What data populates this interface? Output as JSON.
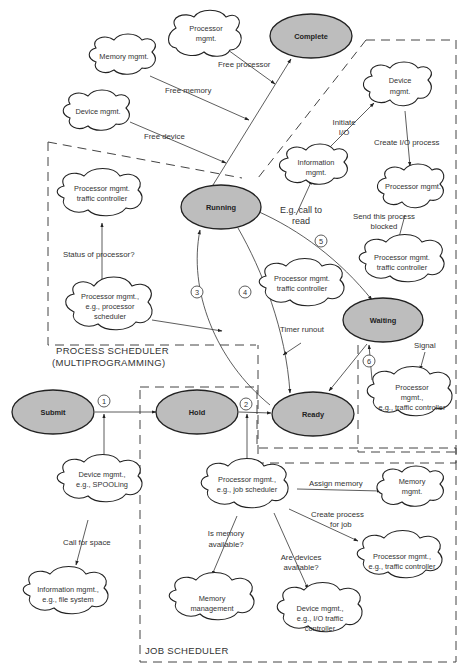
{
  "states": {
    "complete": "Complete",
    "running": "Running",
    "waiting": "Waiting",
    "submit": "Submit",
    "hold": "Hold",
    "ready": "Ready"
  },
  "clouds": {
    "processor_top": [
      "Processor",
      "mgmt."
    ],
    "memory_top": [
      "Memory mgmt."
    ],
    "device_top": [
      "Device mgmt."
    ],
    "device_io": [
      "Device",
      "mgmt."
    ],
    "information": [
      "Information",
      "mgmt."
    ],
    "processor_io": [
      "Processor mgmt."
    ],
    "traffic_left": [
      "Processor mgmt.",
      "traffic controller"
    ],
    "proc_scheduler": [
      "Processor mgmt.,",
      "e.g., processor",
      "scheduler"
    ],
    "traffic_center": [
      "Processor mgmt.",
      "traffic controller"
    ],
    "traffic_right": [
      "Processor mgmt.",
      "traffic controller"
    ],
    "traffic_signal": [
      "Processor",
      "mgmt.,",
      "e.g., traffic controller"
    ],
    "spooling": [
      "Device mgmt.,",
      "e.g., SPOOLing"
    ],
    "file_system": [
      "Information mgmt.,",
      "e.g., file system"
    ],
    "job_scheduler": [
      "Processor mgmt.,",
      "e.g., job scheduler"
    ],
    "memory_assign": [
      "Memory",
      "mgmt."
    ],
    "traffic_job": [
      "Processor mgmt.,",
      "e.g., traffic controller"
    ],
    "memory_management": [
      "Memory",
      "management"
    ],
    "device_io_traffic": [
      "Device mgmt.,",
      "e.g., I/O traffic",
      "controller"
    ]
  },
  "labels": {
    "free_processor": "Free processor",
    "free_memory": "Free memory",
    "free_device": "Free device",
    "initiate_io": [
      "Initiate",
      "I/O"
    ],
    "create_io_process": "Create I/O process",
    "call_to_read": [
      "E.g. call to",
      "read"
    ],
    "send_blocked": [
      "Send this process",
      "blocked"
    ],
    "status_of_processor": "Status of processor?",
    "timer_runout": "Timer runout",
    "signal": "Signal",
    "call_for_space": "Call for space",
    "assign_memory": "Assign memory",
    "create_process_for_job": [
      "Create process",
      "for job"
    ],
    "is_memory_available": [
      "Is memory",
      "available?"
    ],
    "are_devices_available": [
      "Are devices",
      "available?"
    ]
  },
  "transitions": [
    "1",
    "2",
    "3",
    "4",
    "5",
    "6"
  ],
  "regions": {
    "process_scheduler": [
      "PROCESS SCHEDULER",
      "(MULTIPROGRAMMING)"
    ],
    "job_scheduler": "JOB SCHEDULER"
  }
}
